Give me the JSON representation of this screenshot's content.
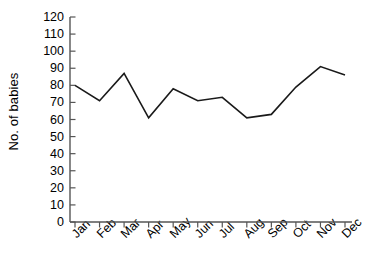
{
  "chart_data": {
    "type": "line",
    "title": "",
    "xlabel": "",
    "ylabel": "No. of babies",
    "categories": [
      "Jan",
      "Feb",
      "Mar",
      "Apr",
      "May",
      "Jun",
      "Jul",
      "Aug",
      "Sep",
      "Oct",
      "Nov",
      "Dec"
    ],
    "values": [
      80,
      71,
      87,
      61,
      78,
      71,
      73,
      61,
      63,
      79,
      91,
      86
    ],
    "series": [
      {
        "name": "No. of babies",
        "values": [
          80,
          71,
          87,
          61,
          78,
          71,
          73,
          61,
          63,
          79,
          91,
          86
        ]
      }
    ],
    "ylim": [
      0,
      120
    ],
    "ytick_labels": [
      "0",
      "10",
      "20",
      "30",
      "40",
      "50",
      "60",
      "70",
      "80",
      "90",
      "100",
      "110",
      "120"
    ],
    "ytick_values": [
      0,
      10,
      20,
      30,
      40,
      50,
      60,
      70,
      80,
      90,
      100,
      110,
      120
    ],
    "grid": false,
    "legend": false,
    "legend_position": "none",
    "line_color": "#1a1a1a",
    "axis_color": "#555555",
    "background_color": "#ffffff",
    "markers": false
  }
}
